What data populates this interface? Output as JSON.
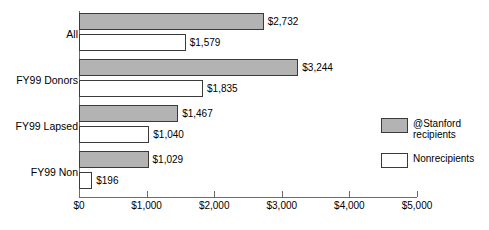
{
  "chart_data": {
    "type": "bar",
    "orientation": "horizontal",
    "title": "",
    "xlabel": "",
    "ylabel": "",
    "categories": [
      "All",
      "FY99 Donors",
      "FY99 Lapsed",
      "FY99 Non"
    ],
    "series": [
      {
        "name": "@Stanford recipients",
        "color": "#b3b3b3",
        "values": [
          2732,
          3244,
          1467,
          1029
        ],
        "labels": [
          "$2,732",
          "$3,244",
          "$1,467",
          "$1,029"
        ]
      },
      {
        "name": "Nonrecipients",
        "color": "#ffffff",
        "values": [
          1579,
          1835,
          1040,
          196
        ],
        "labels": [
          "$1,579",
          "$1,835",
          "$1,040",
          "$196"
        ]
      }
    ],
    "xlim": [
      0,
      5000
    ],
    "xticks": [
      0,
      1000,
      2000,
      3000,
      4000,
      5000
    ],
    "xtick_labels": [
      "$0",
      "$1,000",
      "$2,000",
      "$3,000",
      "$4,000",
      "$5,000"
    ],
    "grid": false,
    "legend_position": "right-middle"
  },
  "legend": {
    "items": [
      {
        "label": "@Stanford recipients",
        "swatch": "recipients"
      },
      {
        "label": "Nonrecipients",
        "swatch": "nonrecipients"
      }
    ]
  }
}
